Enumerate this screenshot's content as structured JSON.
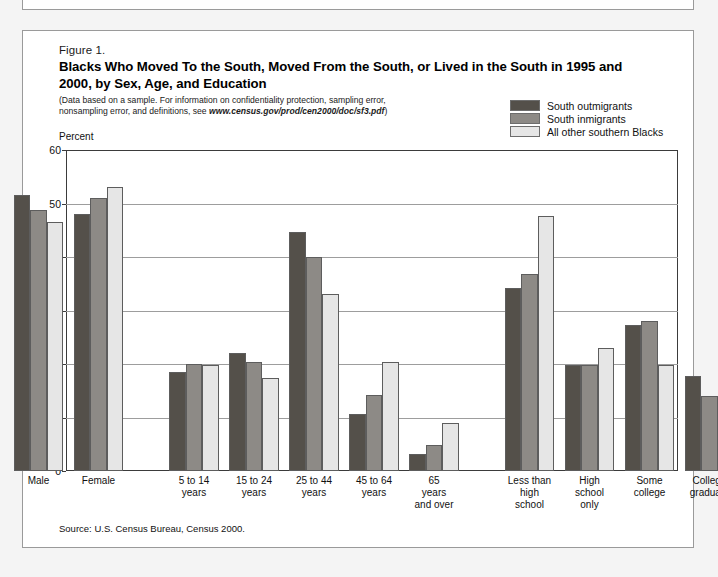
{
  "figure": {
    "number": "Figure 1.",
    "title": "Blacks Who Moved To the South, Moved From the South, or Lived in the South in 1995 and 2000, by Sex, Age, and Education",
    "note_line1": "(Data based on a sample.  For information on confidentiality protection, sampling error,",
    "note_line2_prefix": "nonsampling error, and definitions, see ",
    "note_url": "www.census.gov/prod/cen2000/doc/sf3.pdf",
    "note_line2_suffix": ")",
    "source": "Source: U.S. Census Bureau, Census 2000."
  },
  "colors": {
    "series_dark": "#54504a",
    "series_mid": "#8d8a86",
    "series_light": "#e6e6e6",
    "grid": "#9d9d9d",
    "axis": "#3b3b3b",
    "page_bg": "#f2f2f2",
    "panel_bg": "#ffffff"
  },
  "chart_data": {
    "type": "bar",
    "title": "Blacks Who Moved To the South, Moved From the South, or Lived in the South in 1995 and 2000, by Sex, Age, and Education",
    "ylabel": "Percent",
    "xlabel": "",
    "ylim": [
      0,
      60
    ],
    "yticks": [
      0,
      10,
      20,
      30,
      40,
      50,
      60
    ],
    "grid": true,
    "legend_position": "top-right",
    "categories": [
      "Male",
      "Female",
      "5 to 14\nyears",
      "15 to 24\nyears",
      "25 to 44\nyears",
      "45 to 64\nyears",
      "65\nyears\nand over",
      "Less than\nhigh\nschool",
      "High\nschool\nonly",
      "Some\ncollege",
      "College\ngraduate"
    ],
    "group_breaks_after": [
      "Female",
      "65\nyears\nand over"
    ],
    "series": [
      {
        "name": "South outmigrants",
        "color": "#54504a",
        "values": [
          51.6,
          48.1,
          18.5,
          22.0,
          44.6,
          10.6,
          3.2,
          34.3,
          19.8,
          27.3,
          17.8
        ]
      },
      {
        "name": "South inmigrants",
        "color": "#8d8a86",
        "values": [
          48.8,
          51.1,
          20.0,
          20.3,
          40.0,
          14.3,
          4.8,
          36.9,
          19.9,
          28.1,
          14.0
        ]
      },
      {
        "name": "All other southern Blacks",
        "color": "#e6e6e6",
        "values": [
          46.5,
          53.0,
          19.9,
          17.3,
          33.0,
          20.3,
          9.0,
          47.7,
          23.0,
          19.9,
          8.5
        ]
      }
    ]
  },
  "legend": [
    {
      "label": "South outmigrants",
      "color": "#54504a"
    },
    {
      "label": "South inmigrants",
      "color": "#8d8a86"
    },
    {
      "label": "All other southern Blacks",
      "color": "#e6e6e6"
    }
  ]
}
